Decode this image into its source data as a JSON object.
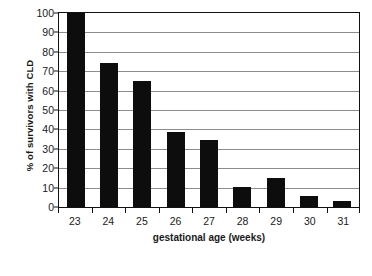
{
  "chart_data": {
    "type": "bar",
    "title": "",
    "xlabel": "gestational age (weeks)",
    "ylabel": "% of survivors with CLD",
    "categories": [
      "23",
      "24",
      "25",
      "26",
      "27",
      "28",
      "29",
      "30",
      "31"
    ],
    "values": [
      100,
      74,
      65,
      38.5,
      34.5,
      10.5,
      15,
      5.5,
      3
    ],
    "ylim": [
      0,
      100
    ],
    "yticks": [
      "0",
      "10",
      "20",
      "30",
      "40",
      "50",
      "60",
      "70",
      "80",
      "90",
      "100"
    ],
    "ytick_values": [
      0,
      10,
      20,
      30,
      40,
      50,
      60,
      70,
      80,
      90,
      100
    ],
    "grid": "horizontal",
    "legend": "none",
    "bar_color": "#0d0d0d",
    "grid_color": "#8c8c8c",
    "axis_color": "#111111",
    "background": "#ffffff"
  }
}
